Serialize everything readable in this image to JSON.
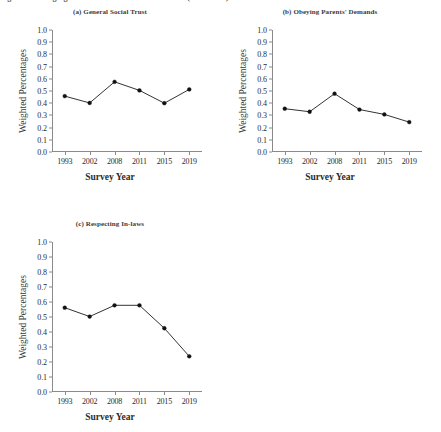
{
  "figure": {
    "caption_sliver": "Figure 1. Changing Social Norms in Mainland China (1993-2019)",
    "ylabel": "Weighted Percentages",
    "xlabel": "Survey Year"
  },
  "chart_data": [
    {
      "type": "line",
      "panel": "a",
      "title": "(a) General Social Trust",
      "categories": [
        "1993",
        "2002",
        "2008",
        "2011",
        "2015",
        "2019"
      ],
      "x": [
        1993,
        2002,
        2008,
        2011,
        2015,
        2019
      ],
      "values": [
        0.458,
        0.402,
        0.575,
        0.505,
        0.4,
        0.513
      ],
      "xlabel": "Survey Year",
      "ylabel": "Weighted Percentages",
      "ylim": [
        0.0,
        1.0
      ],
      "yticks": [
        "0.0",
        "0.1",
        "0.2",
        "0.3",
        "0.4",
        "0.5",
        "0.6",
        "0.7",
        "0.8",
        "0.9",
        "1.0"
      ],
      "grid": false,
      "legend": "none",
      "marker": "filled-circle",
      "line_color": "#1c1c1c"
    },
    {
      "type": "line",
      "panel": "b",
      "title": "(b) Obeying Parents' Demands",
      "categories": [
        "1993",
        "2002",
        "2008",
        "2011",
        "2015",
        "2019"
      ],
      "x": [
        1993,
        2002,
        2008,
        2011,
        2015,
        2019
      ],
      "values": [
        0.355,
        0.33,
        0.478,
        0.348,
        0.308,
        0.245
      ],
      "xlabel": "Survey Year",
      "ylabel": "Weighted Percentages",
      "ylim": [
        0.0,
        1.0
      ],
      "yticks": [
        "0.0",
        "0.1",
        "0.2",
        "0.3",
        "0.4",
        "0.5",
        "0.6",
        "0.7",
        "0.8",
        "0.9",
        "1.0"
      ],
      "grid": false,
      "legend": "none",
      "marker": "filled-circle",
      "line_color": "#1c1c1c"
    },
    {
      "type": "line",
      "panel": "c",
      "title": "(c) Respecting In-laws",
      "categories": [
        "1993",
        "2002",
        "2008",
        "2011",
        "2015",
        "2019"
      ],
      "x": [
        1993,
        2002,
        2008,
        2011,
        2015,
        2019
      ],
      "values": [
        0.562,
        0.503,
        0.578,
        0.578,
        0.425,
        0.238
      ],
      "xlabel": "Survey Year",
      "ylabel": "Weighted Percentages",
      "ylim": [
        0.0,
        1.0
      ],
      "yticks": [
        "0.0",
        "0.1",
        "0.2",
        "0.3",
        "0.4",
        "0.5",
        "0.6",
        "0.7",
        "0.8",
        "0.9",
        "1.0"
      ],
      "grid": false,
      "legend": "none",
      "marker": "filled-circle",
      "line_color": "#1c1c1c"
    }
  ]
}
